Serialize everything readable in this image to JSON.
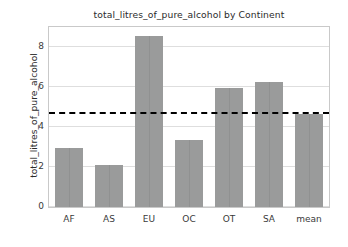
{
  "chart_data": {
    "type": "bar",
    "title": "total_litres_of_pure_alcohol by Continent",
    "xlabel": "",
    "ylabel": "total_litres_of_pure_alcohol",
    "categories": [
      "AF",
      "AS",
      "EU",
      "OC",
      "OT",
      "SA",
      "mean"
    ],
    "values": [
      2.96,
      2.12,
      8.55,
      3.33,
      5.95,
      6.25,
      4.66
    ],
    "ylim": [
      0,
      9
    ],
    "yticks": [
      0,
      2,
      4,
      6,
      8
    ],
    "ytick_labels": [
      "0",
      "2",
      "4",
      "6",
      "8"
    ],
    "grid": true,
    "legend": "none",
    "annotations": [
      {
        "name": "mean-reference-line",
        "style": "dashed",
        "color": "#000000",
        "value": 4.66
      }
    ],
    "bar_color": "#9a9b9b",
    "grid_color": "#dedede",
    "axis_color": "#c9c9c9"
  }
}
